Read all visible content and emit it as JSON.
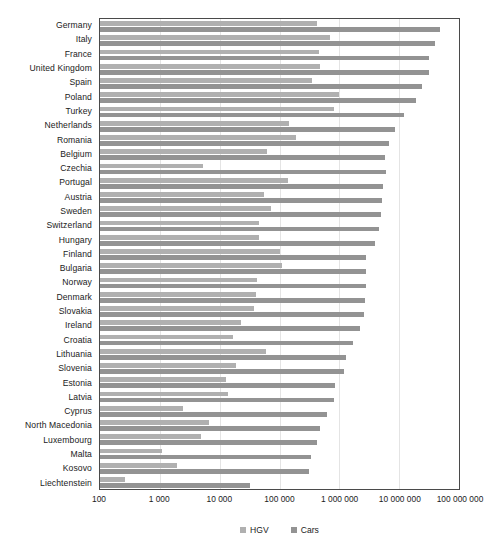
{
  "chart_data": {
    "type": "bar",
    "title": "",
    "subtitle": "",
    "orientation": "horizontal",
    "xlabel": "",
    "ylabel": "",
    "xscale": "log",
    "xlim": [
      100,
      100000000
    ],
    "grid": true,
    "legend_position": "bottom",
    "axis_tick_labels": [
      "100",
      "1 000",
      "10 000",
      "100 000",
      "1 000 000",
      "10 000 000",
      "100 000 000"
    ],
    "axis_tick_values": [
      100,
      1000,
      10000,
      100000,
      1000000,
      10000000,
      100000000
    ],
    "categories": [
      "Germany",
      "Italy",
      "France",
      "United Kingdom",
      "Spain",
      "Poland",
      "Turkey",
      "Netherlands",
      "Romania",
      "Belgium",
      "Czechia",
      "Portugal",
      "Austria",
      "Sweden",
      "Switzerland",
      "Hungary",
      "Finland",
      "Bulgaria",
      "Norway",
      "Denmark",
      "Slovakia",
      "Ireland",
      "Croatia",
      "Lithuania",
      "Slovenia",
      "Estonia",
      "Latvia",
      "Cyprus",
      "North Macedonia",
      "Luxembourg",
      "Malta",
      "Kosovo",
      "Liechtenstein"
    ],
    "series": [
      {
        "name": "HGV",
        "color": "#b0b0b0",
        "values": [
          430000,
          700000,
          450000,
          480000,
          350000,
          1000000,
          800000,
          145000,
          190000,
          62000,
          5200,
          140000,
          55000,
          73000,
          46000,
          45000,
          100000,
          110000,
          42000,
          40000,
          38000,
          23000,
          17000,
          60000,
          19000,
          13000,
          14000,
          2400,
          6600,
          4800,
          1100,
          1900,
          260
        ]
      },
      {
        "name": "Cars",
        "color": "#939393",
        "values": [
          48000000,
          39000000,
          32000000,
          32000000,
          24000000,
          19000000,
          12000000,
          8600000,
          6800000,
          5800000,
          6000000,
          5300000,
          5100000,
          4900000,
          4600000,
          3900000,
          2800000,
          2800000,
          2800000,
          2700000,
          2600000,
          2200000,
          1700000,
          1300000,
          1200000,
          850000,
          800000,
          620000,
          480000,
          430000,
          330000,
          310000,
          32000
        ]
      }
    ],
    "legend": [
      {
        "label": "HGV",
        "color": "#b0b0b0"
      },
      {
        "label": "Cars",
        "color": "#939393"
      }
    ]
  }
}
